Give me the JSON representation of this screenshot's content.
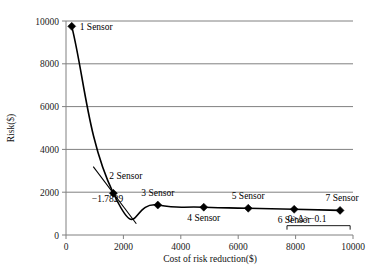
{
  "chart_data": {
    "type": "line",
    "title": "",
    "xlabel": "Cost of risk reduction($)",
    "ylabel": "Risk($)",
    "xlim": [
      0,
      10000
    ],
    "ylim": [
      0,
      10000
    ],
    "xticks": [
      "0",
      "2000",
      "4000",
      "6000",
      "8000",
      "10000"
    ],
    "xtick_values": [
      0,
      2000,
      4000,
      6000,
      8000,
      10000
    ],
    "yticks": [
      "0",
      "2000",
      "4000",
      "6000",
      "8000",
      "10000"
    ],
    "ytick_values": [
      0,
      2000,
      4000,
      6000,
      8000,
      10000
    ],
    "grid": "horizontal",
    "legend": "none",
    "series": [
      {
        "name": "Risk vs cost of risk reduction",
        "x": [
          200,
          1650,
          3200,
          4800,
          6350,
          7950,
          9550
        ],
        "y": [
          9750,
          1950,
          1400,
          1300,
          1250,
          1200,
          1150
        ],
        "point_labels": [
          "1 Sensor",
          "2 Sensor",
          "3 Sensor",
          "4 Sensor",
          "5 Sensor",
          "6 Sensor",
          "7 Sensor"
        ]
      }
    ],
    "annotations": [
      {
        "name": "tangent-slope",
        "text": "−1.7829",
        "x": 900,
        "y": 1550,
        "describes": "slope of tangent line at the 2 Sensor point"
      },
      {
        "name": "flat-slope-range",
        "text": "0>Δ>−0.1",
        "x": 8400,
        "y": 600,
        "describes": "slope range over the 6 to 7 Sensor segment"
      }
    ],
    "tangent": {
      "name": "tangent-at-2-sensor",
      "slope": -1.7829,
      "touch_point": [
        1650,
        1950
      ],
      "x_from": 950,
      "x_to": 2450
    }
  },
  "chart": {
    "y_axis_title": "Risk($)",
    "x_axis_title": "Cost of risk reduction($)"
  }
}
